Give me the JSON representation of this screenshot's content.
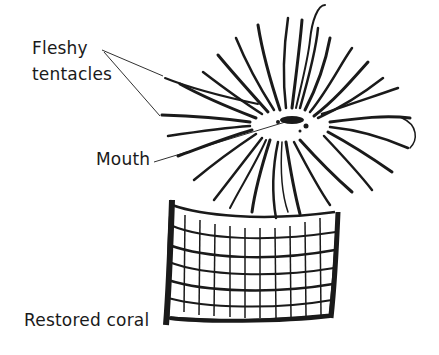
{
  "diagram": {
    "labels": {
      "fleshy_tentacles_line1": "Fleshy",
      "fleshy_tentacles_line2": "tentacles",
      "mouth": "Mouth",
      "restored_coral": "Restored coral"
    },
    "colors": {
      "ink": "#1a1a1a",
      "background": "#ffffff"
    }
  }
}
